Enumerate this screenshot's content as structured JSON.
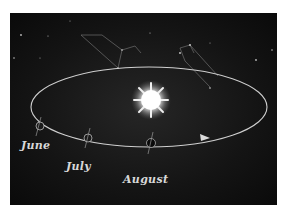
{
  "illustration": {
    "subject": "Earth orbiting the Sun with constellations in background",
    "months": [
      {
        "label": "June"
      },
      {
        "label": "July"
      },
      {
        "label": "August"
      }
    ],
    "colors": {
      "background": "#ffffff",
      "sky": "#141414",
      "orbit": "#d0d0d0",
      "sun": "#ffffff",
      "label": "#d8d8d8"
    }
  }
}
